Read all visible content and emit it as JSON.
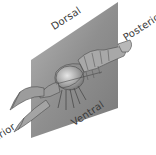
{
  "diagram": {
    "plane": "sagittal plane",
    "labels": {
      "dorsal": "Dorsal",
      "posterior": "Posterior",
      "ventral": "Ventral",
      "anterior": "Anterior"
    },
    "colors": {
      "plane": "#8e8e8e",
      "plane_light": "#b0b0b0",
      "body": "#9a9a9a",
      "body_highlight": "#d0d0d0",
      "outline": "#4a4a4a",
      "text": "#3a3a3a"
    }
  }
}
